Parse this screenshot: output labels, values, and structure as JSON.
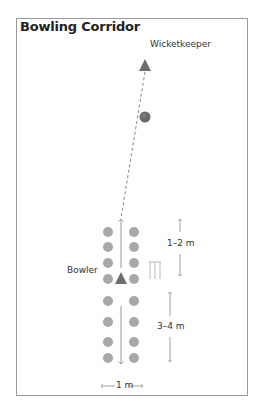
{
  "title": "Bowling Corridor",
  "labels": {
    "wicketkeeper": "Wicketkeeper",
    "bowler": "Bowler",
    "gap_distance": "1–2 m",
    "runup_distance": "3–4 m",
    "width_distance": "1 m"
  },
  "colors": {
    "cone": "#a8a8a8",
    "player": "#6e6e6e",
    "ball": "#6a6a6a",
    "arrow": "#8a8a8a",
    "frame": "#9a9a9a"
  },
  "cones": {
    "columns_x": [
      108,
      134
    ],
    "rows_y": [
      232,
      247,
      263,
      279,
      301,
      322,
      342,
      358
    ]
  },
  "players": [
    {
      "role": "wicketkeeper",
      "x": 145,
      "y": 66
    },
    {
      "role": "bowler",
      "x": 121,
      "y": 279
    }
  ],
  "ball": {
    "x": 145,
    "y": 117
  }
}
